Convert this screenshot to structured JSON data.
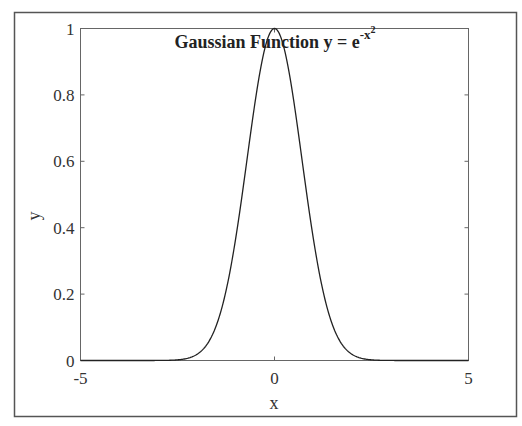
{
  "chart_data": {
    "type": "line",
    "title": {
      "main": "Gaussian Function y = e",
      "superscript_base": "-x",
      "superscript_exp": "2"
    },
    "xlabel": "x",
    "ylabel": "y",
    "xlim": [
      -5,
      5
    ],
    "ylim": [
      0,
      1
    ],
    "xticks": [
      -5,
      0,
      5
    ],
    "xtick_labels": [
      "-5",
      "0",
      "5"
    ],
    "yticks": [
      0,
      0.2,
      0.4,
      0.6,
      0.8,
      1
    ],
    "ytick_labels": [
      "0",
      "0.2",
      "0.4",
      "0.6",
      "0.8",
      "1"
    ],
    "grid": false,
    "box": true,
    "legend": null,
    "series": [
      {
        "name": "y = exp(-x^2)",
        "function": "exp(-x^2)",
        "x": [
          -5,
          -4,
          -3,
          -2.5,
          -2,
          -1.5,
          -1,
          -0.5,
          0,
          0.5,
          1,
          1.5,
          2,
          2.5,
          3,
          4,
          5
        ],
        "y": [
          0.0,
          0.0,
          0.0001,
          0.0019,
          0.0183,
          0.1054,
          0.3679,
          0.7788,
          1.0,
          0.7788,
          0.3679,
          0.1054,
          0.0183,
          0.0019,
          0.0001,
          0.0,
          0.0
        ],
        "color": "#222222"
      }
    ]
  },
  "colors": {
    "frame": "#555555",
    "axes": "#666666",
    "line": "#222222"
  }
}
